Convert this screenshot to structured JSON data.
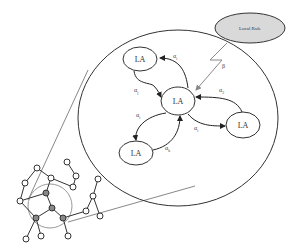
{
  "diagram": {
    "type": "cellular-learning-automata",
    "local_rule": {
      "label": "Local Rule",
      "fill": "#d9d9d9"
    },
    "reinforcement_label": "β",
    "automata": [
      {
        "id": "center",
        "label": "LA"
      },
      {
        "id": "top-left",
        "label": "LA"
      },
      {
        "id": "right",
        "label": "LA"
      },
      {
        "id": "bottom-left",
        "label": "LA"
      }
    ],
    "edge_labels": {
      "top_out": "α",
      "top_in": "α",
      "right_in": "α",
      "right_out": "α",
      "bottom_out": "α",
      "bottom_in": "α"
    },
    "edge_subscripts": {
      "top_out": "i",
      "top_in": "j",
      "right_in": "2",
      "right_out": "i",
      "bottom_out": "i",
      "bottom_in": "k"
    },
    "colors": {
      "stroke": "#333333",
      "zoom_lines": "#888888",
      "node_fill_highlight": "#888888",
      "node_fill": "#ffffff"
    }
  }
}
